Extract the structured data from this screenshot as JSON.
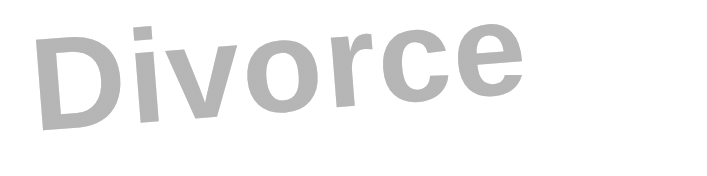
{
  "image": {
    "text": "Divorce",
    "text_color": "#c4c4c4",
    "background_color": "#ffffff",
    "rotation_deg": -4.5,
    "style": "gray halftone bold sans-serif word"
  }
}
